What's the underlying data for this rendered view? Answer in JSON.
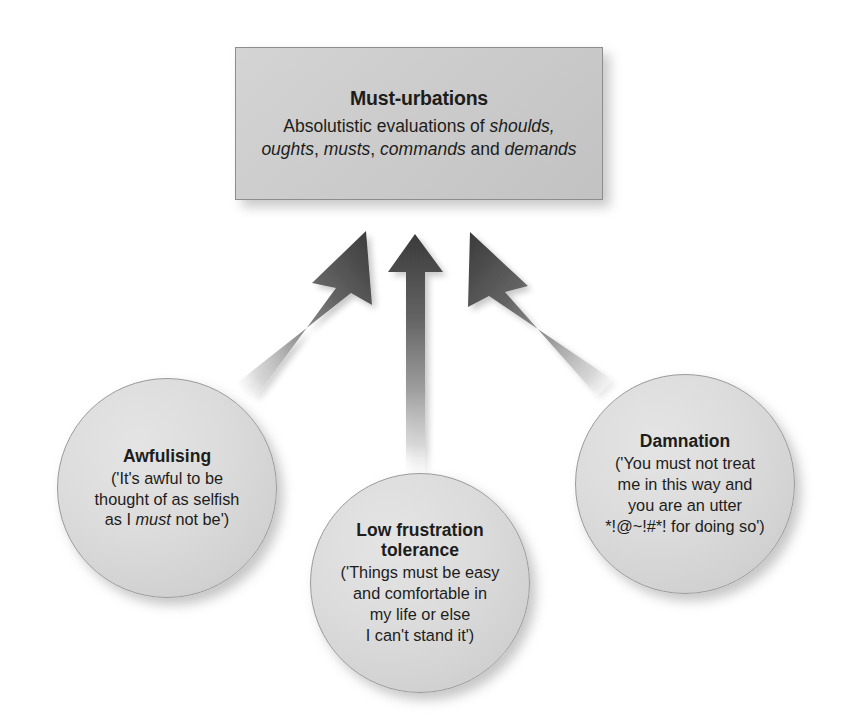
{
  "diagram": {
    "type": "convergent-arrow-diagram",
    "background_color": "#ffffff",
    "central_node": {
      "shape": "rectangle",
      "title": "Must-urbations",
      "description_line_1_prefix": "Absolutistic evaluations of ",
      "description_line_1_italic": "shoulds,",
      "description_line_2_italic_a": "oughts",
      "description_line_2_sep_a": ", ",
      "description_line_2_italic_b": "musts",
      "description_line_2_sep_b": ", ",
      "description_line_2_italic_c": "commands",
      "description_line_2_sep_c": " and ",
      "description_line_2_italic_d": "demands",
      "fill_color": "#c9c9c9",
      "border_color": "#8d8d8d"
    },
    "nodes": [
      {
        "id": "awfulising",
        "shape": "circle",
        "title": "Awfulising",
        "quote_line_1": "('It's awful to be",
        "quote_line_2": "thought of as selfish",
        "quote_line_3_pre": "as I ",
        "quote_line_3_italic": "must",
        "quote_line_3_post": " not be')",
        "fill_color": "#dcdcdc",
        "border_color": "#9a9a9a"
      },
      {
        "id": "low-frustration-tolerance",
        "shape": "circle",
        "title_line_1": "Low frustration",
        "title_line_2": "tolerance",
        "quote_line_1": "('Things must be easy",
        "quote_line_2": "and comfortable in",
        "quote_line_3": "my life or else",
        "quote_line_4": "I can't stand it')",
        "fill_color": "#dcdcdc",
        "border_color": "#9a9a9a"
      },
      {
        "id": "damnation",
        "shape": "circle",
        "title": "Damnation",
        "quote_line_1": "('You must not treat",
        "quote_line_2": "me in this way and",
        "quote_line_3": "you are an utter",
        "quote_line_4": "*!@~!#*! for doing so')",
        "fill_color": "#dcdcdc",
        "border_color": "#9a9a9a"
      }
    ],
    "arrows": [
      {
        "id": "arrow-awfulising-to-must-urbations",
        "from": "awfulising",
        "to": "central_node",
        "direction": "up-right",
        "style": "gradient-fade-tail",
        "head_color": "#3b3b3b"
      },
      {
        "id": "arrow-lft-to-must-urbations",
        "from": "low-frustration-tolerance",
        "to": "central_node",
        "direction": "up",
        "style": "gradient-fade-tail",
        "head_color": "#3b3b3b"
      },
      {
        "id": "arrow-damnation-to-must-urbations",
        "from": "damnation",
        "to": "central_node",
        "direction": "up-left",
        "style": "gradient-fade-tail",
        "head_color": "#3b3b3b"
      }
    ]
  }
}
